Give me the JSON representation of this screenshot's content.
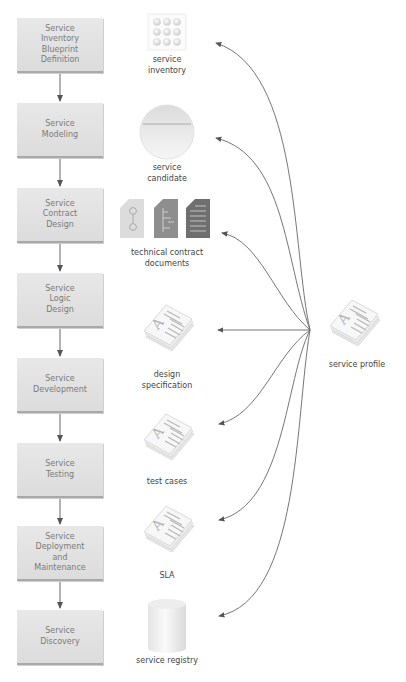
{
  "diagram": {
    "type": "service-lifecycle-flow",
    "colors": {
      "box_fill": "#e2e2e2",
      "box_text": "#7a7a7a",
      "arrow": "#666666",
      "label_text": "#444444"
    },
    "steps": [
      {
        "label": "Service\nInventory\nBlueprint\nDefinition"
      },
      {
        "label": "Service\nModeling"
      },
      {
        "label": "Service\nContract\nDesign"
      },
      {
        "label": "Service\nLogic\nDesign"
      },
      {
        "label": "Service\nDevelopment"
      },
      {
        "label": "Service\nTesting"
      },
      {
        "label": "Service\nDeployment\nand\nMaintenance"
      },
      {
        "label": "Service\nDiscovery"
      }
    ],
    "artifacts": [
      {
        "label": "service\ninventory",
        "icon": "service-inventory-grid-icon"
      },
      {
        "label": "service\ncandidate",
        "icon": "service-candidate-circle-icon"
      },
      {
        "label": "technical contract\ndocuments",
        "icon": "technical-contract-documents-icon"
      },
      {
        "label": "design\nspecification",
        "icon": "document-stack-icon"
      },
      {
        "label": "test cases",
        "icon": "document-stack-icon"
      },
      {
        "label": "SLA",
        "icon": "document-stack-icon"
      },
      {
        "label": "service registry",
        "icon": "database-cylinder-icon"
      }
    ],
    "hub": {
      "label": "service profile",
      "icon": "document-stack-icon"
    }
  }
}
